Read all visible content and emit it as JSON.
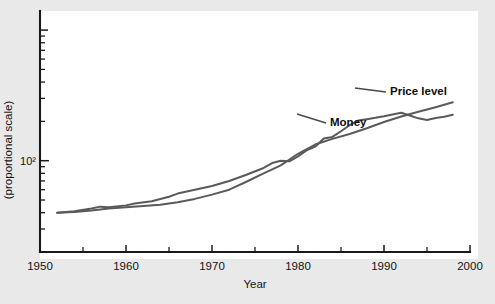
{
  "page": {
    "background_color": "#e9e9e9",
    "plot_background_color": "#ffffff"
  },
  "chart_data": {
    "type": "line",
    "title": "",
    "xlabel": "Year",
    "ylabel": "(proportional scale)",
    "ylabel_tick": "10²",
    "xlim": [
      1950,
      2000
    ],
    "ylim_log": [
      20,
      1400
    ],
    "y_scale": "log",
    "x_scale": "linear",
    "grid": false,
    "legend_position": "inline-annotations",
    "x_ticks_major": [
      1950,
      1960,
      1970,
      1980,
      1990,
      2000
    ],
    "x_tick_labels": [
      "1950",
      "1960",
      "1970",
      "1980",
      "1990",
      "2000"
    ],
    "x_ticks_minor": [
      1955,
      1965,
      1975,
      1985,
      1995
    ],
    "y_ticks_labeled": [
      100
    ],
    "y_tick_labels": [
      "10²"
    ],
    "y_ticks_minor": [
      20,
      30,
      40,
      50,
      60,
      70,
      80,
      90,
      200,
      300,
      400,
      500,
      600,
      700,
      800,
      900,
      1000
    ],
    "line_color": "#5a5a5a",
    "axis_color": "#1a1a1a",
    "annotations": [
      {
        "label": "Price level",
        "text_x": 390,
        "text_y": 95,
        "leader_from_x": 355,
        "leader_from_y": 88,
        "leader_to_x": 386,
        "leader_to_y": 92
      },
      {
        "label": "Money",
        "text_x": 330,
        "text_y": 126,
        "leader_from_x": 297,
        "leader_from_y": 114,
        "leader_to_x": 326,
        "leader_to_y": 123
      }
    ],
    "series": [
      {
        "name": "Price level",
        "x": [
          1952,
          1954,
          1956,
          1958,
          1960,
          1962,
          1964,
          1966,
          1968,
          1970,
          1972,
          1974,
          1976,
          1978,
          1980,
          1982,
          1984,
          1986,
          1988,
          1990,
          1992,
          1994,
          1996,
          1998
        ],
        "values": [
          40,
          40.5,
          41.5,
          43,
          44,
          45,
          46,
          48,
          51,
          55,
          60,
          69,
          80,
          92,
          113,
          133,
          147,
          160,
          177,
          198,
          218,
          237,
          257,
          280
        ]
      },
      {
        "name": "Money",
        "x": [
          1952,
          1954,
          1956,
          1957,
          1958,
          1960,
          1961,
          1963,
          1965,
          1966,
          1968,
          1970,
          1972,
          1974,
          1976,
          1977,
          1978,
          1979,
          1980,
          1981,
          1982,
          1983,
          1984,
          1985,
          1986,
          1987,
          1988,
          1989,
          1990,
          1991,
          1992,
          1993,
          1994,
          1995,
          1996,
          1997,
          1998
        ],
        "values": [
          40,
          41,
          43,
          44.5,
          44,
          45.5,
          47,
          49,
          53,
          56,
          60,
          64,
          70,
          78,
          88,
          96,
          100,
          99,
          108,
          120,
          128,
          148,
          152,
          168,
          187,
          203,
          208,
          213,
          219,
          226,
          233,
          222,
          211,
          205,
          212,
          217,
          225
        ]
      }
    ]
  },
  "axis_geometry": {
    "plot_left": 40,
    "plot_right": 470,
    "plot_top": 11,
    "plot_bottom": 252,
    "white_left": 40,
    "white_top": 11,
    "white_width": 438,
    "white_height": 248
  }
}
